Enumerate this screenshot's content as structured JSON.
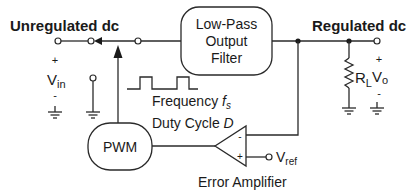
{
  "diagram": {
    "type": "block-diagram",
    "labels": {
      "input": "Unregulated dc",
      "output": "Regulated dc",
      "vin_main": "V",
      "vin_sub": "in",
      "vin_plus": "+",
      "vin_minus": "-",
      "vo_main": "V",
      "vo_sub": "o",
      "vo_plus": "+",
      "vo_minus": "-",
      "rl_main": "R",
      "rl_sub": "L",
      "vref_main": "V",
      "vref_sub": "ref",
      "frequency_text": "Frequency ",
      "frequency_var": "f",
      "frequency_sub": "s",
      "duty_text": "Duty Cycle ",
      "duty_var": "D",
      "error_amp": "Error Amplifier",
      "opamp_minus": "-",
      "opamp_plus": "+"
    },
    "blocks": {
      "filter_line1": "Low-Pass",
      "filter_line2": "Output",
      "filter_line3": "Filter",
      "pwm": "PWM"
    },
    "colors": {
      "line": "#2a2a2a",
      "text": "#1a1a1a",
      "background": "#ffffff"
    }
  }
}
